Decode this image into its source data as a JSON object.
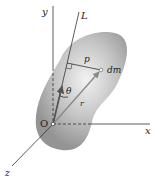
{
  "diagram": {
    "labels": {
      "y_axis": "y",
      "x_axis": "x",
      "z_axis": "z",
      "axis_L": "L",
      "distance": "p",
      "mass_element": "dm",
      "position_vector": "r",
      "angle": "θ",
      "origin": "O"
    },
    "colors": {
      "body_light": "#e6e6e6",
      "body_dark": "#9a9a9a",
      "lines": "#333333",
      "vector": "#777777"
    }
  }
}
